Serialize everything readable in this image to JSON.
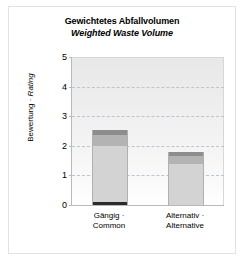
{
  "chart_data": {
    "type": "bar",
    "subtype": "stacked",
    "title": "Gewichtetes Abfallvolumen",
    "subtitle": "Weighted Waste Volume",
    "xlabel": "",
    "ylabel": "Bewertung · Rating",
    "ylabel_parts": {
      "de": "Bewertung · ",
      "en": "Rating"
    },
    "categories": [
      "Gängig · Common",
      "Alternativ · Alternative"
    ],
    "category_lines": [
      [
        "Gängig ·",
        "Common"
      ],
      [
        "Alternativ ·",
        "Alternative"
      ]
    ],
    "ylim": [
      0,
      5
    ],
    "yticks": [
      0,
      1,
      2,
      3,
      4,
      5
    ],
    "ytick_labels": [
      "0",
      "1",
      "2",
      "3",
      "4",
      "5"
    ],
    "grid": true,
    "grid_style": "dashed",
    "grid_color": "#b9c4d6",
    "legend": "none",
    "totals": [
      2.55,
      1.8
    ],
    "series": [
      {
        "name": "segment-base",
        "values": [
          0.1,
          0.0
        ],
        "color": "#2b2b2b"
      },
      {
        "name": "segment-body",
        "values": [
          1.9,
          1.4
        ],
        "color": "#d3d3d3"
      },
      {
        "name": "segment-mid",
        "values": [
          0.35,
          0.25
        ],
        "color": "#b3b3b3"
      },
      {
        "name": "segment-top",
        "values": [
          0.2,
          0.15
        ],
        "color": "#8d8d8d"
      }
    ],
    "bars": [
      {
        "category": "Gängig · Common",
        "total": 2.55,
        "stack": [
          {
            "name": "segment-base",
            "from": 0.0,
            "to": 0.1,
            "color": "#2b2b2b"
          },
          {
            "name": "segment-body",
            "from": 0.1,
            "to": 2.0,
            "color": "#d3d3d3"
          },
          {
            "name": "segment-mid",
            "from": 2.0,
            "to": 2.35,
            "color": "#b3b3b3"
          },
          {
            "name": "segment-top",
            "from": 2.35,
            "to": 2.55,
            "color": "#8d8d8d"
          }
        ]
      },
      {
        "category": "Alternativ · Alternative",
        "total": 1.8,
        "stack": [
          {
            "name": "segment-body",
            "from": 0.0,
            "to": 1.4,
            "color": "#d3d3d3"
          },
          {
            "name": "segment-mid",
            "from": 1.4,
            "to": 1.65,
            "color": "#b3b3b3"
          },
          {
            "name": "segment-top",
            "from": 1.65,
            "to": 1.8,
            "color": "#8d8d8d"
          }
        ]
      }
    ]
  },
  "style": {
    "frame_border": "#e2e2e2",
    "axis_color": "#b9b9b9",
    "bar_outline": "#b0b0b0",
    "plot_bg_top": "#e8e8e8",
    "plot_bg_bottom": "#ffffff",
    "text_color": "#000000"
  }
}
